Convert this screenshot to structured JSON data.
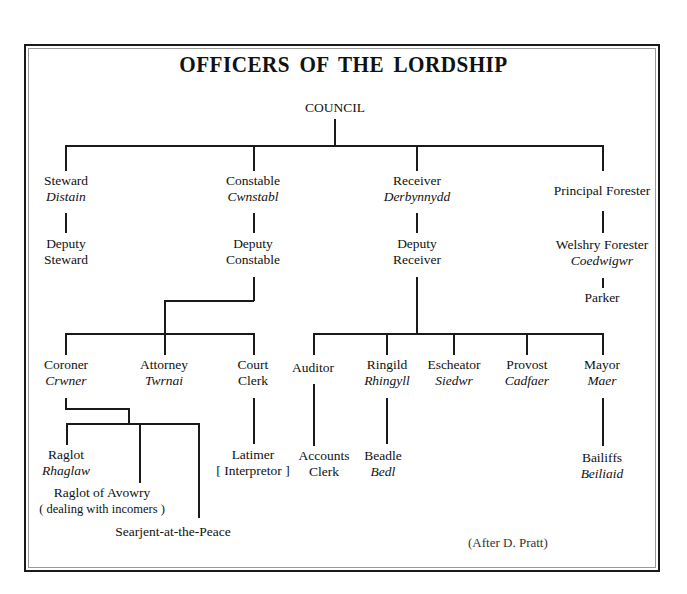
{
  "title": "OFFICERS OF THE LORDSHIP",
  "credit": "(After D. Pratt)",
  "nodes": {
    "council": {
      "name": "COUNCIL"
    },
    "steward": {
      "name": "Steward",
      "welsh": "Distain"
    },
    "deputy_steward": {
      "line1": "Deputy",
      "line2": "Steward"
    },
    "constable": {
      "name": "Constable",
      "welsh": "Cwnstabl"
    },
    "deputy_constable": {
      "line1": "Deputy",
      "line2": "Constable"
    },
    "receiver": {
      "name": "Receiver",
      "welsh": "Derbynnydd"
    },
    "deputy_receiver": {
      "line1": "Deputy",
      "line2": "Receiver"
    },
    "principal_forester": {
      "name": "Principal Forester"
    },
    "welshry_forester": {
      "name": "Welshry Forester",
      "welsh": "Coedwigwr"
    },
    "parker": {
      "name": "Parker"
    },
    "coroner": {
      "name": "Coroner",
      "welsh": "Crwner"
    },
    "attorney": {
      "name": "Attorney",
      "welsh": "Twrnai"
    },
    "court_clerk": {
      "line1": "Court",
      "line2": "Clerk"
    },
    "auditor": {
      "name": "Auditor"
    },
    "ringild": {
      "name": "Ringild",
      "welsh": "Rhingyll"
    },
    "escheator": {
      "name": "Escheator",
      "welsh": "Siedwr"
    },
    "provost": {
      "name": "Provost",
      "welsh": "Cadfaer"
    },
    "mayor": {
      "name": "Mayor",
      "welsh": "Maer"
    },
    "raglot": {
      "name": "Raglot",
      "welsh": "Rhaglaw"
    },
    "raglot_avowry": {
      "line1": "Raglot of Avowry",
      "line2": "( dealing with incomers )"
    },
    "searjent": {
      "name": "Searjent-at-the-Peace"
    },
    "latimer": {
      "line1": "Latimer",
      "line2": "[ Interpretor ]"
    },
    "accounts_clerk": {
      "line1": "Accounts",
      "line2": "Clerk"
    },
    "beadle": {
      "name": "Beadle",
      "welsh": "Bedl"
    },
    "bailiffs": {
      "name": "Bailiffs",
      "welsh": "Beiliaid"
    }
  },
  "edges": [
    [
      "COUNCIL",
      "Steward"
    ],
    [
      "COUNCIL",
      "Constable"
    ],
    [
      "COUNCIL",
      "Receiver"
    ],
    [
      "COUNCIL",
      "Principal Forester"
    ],
    [
      "Steward",
      "Deputy Steward"
    ],
    [
      "Constable",
      "Deputy Constable"
    ],
    [
      "Receiver",
      "Deputy Receiver"
    ],
    [
      "Principal Forester",
      "Welshry Forester"
    ],
    [
      "Welshry Forester",
      "Parker"
    ],
    [
      "Deputy Constable",
      "Coroner"
    ],
    [
      "Deputy Constable",
      "Attorney"
    ],
    [
      "Deputy Constable",
      "Court Clerk"
    ],
    [
      "Deputy Receiver",
      "Auditor"
    ],
    [
      "Deputy Receiver",
      "Ringild"
    ],
    [
      "Deputy Receiver",
      "Escheator"
    ],
    [
      "Deputy Receiver",
      "Provost"
    ],
    [
      "Deputy Receiver",
      "Mayor"
    ],
    [
      "Coroner",
      "Raglot"
    ],
    [
      "Coroner",
      "Raglot of Avowry"
    ],
    [
      "Coroner",
      "Searjent-at-the-Peace"
    ],
    [
      "Court Clerk",
      "Latimer"
    ],
    [
      "Auditor",
      "Accounts Clerk"
    ],
    [
      "Ringild",
      "Beadle"
    ],
    [
      "Mayor",
      "Bailiffs"
    ]
  ]
}
